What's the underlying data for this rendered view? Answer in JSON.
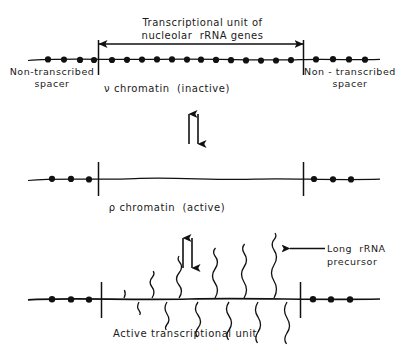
{
  "figure": {
    "title_line1": "Transcriptional unit of",
    "title_line2": "nucleolar  rRNA genes",
    "title_full": "Transcriptional unit of nucleolar rRNA genes",
    "caption": "Active transcriptional unit"
  },
  "labels": {
    "spacer_left": "Non-transcribed\nspacer",
    "spacer_right": "Non - transcribed\nspacer",
    "nu_chromatin": "ν chromatin  (inactive)",
    "rho_chromatin": "ρ chromatin  (active)",
    "long_rrna_precursor": "Long  rRNA\nprecursor"
  },
  "panels": [
    {
      "name": "inactive-chromatin-panel",
      "state": "ν chromatin (inactive)",
      "description": "DNA axis studded with evenly spaced nucleosome beads across spacer and transcription unit",
      "nucleosomes_left_spacer": 4,
      "nucleosomes_transcription_unit": 14,
      "nucleosomes_right_spacer": 4,
      "boundary_ticks": 2
    },
    {
      "name": "active-chromatin-panel",
      "state": "ρ chromatin (active)",
      "description": "Nucleosome beads only on flanking spacers; transcription unit is a smooth bead-free fibre",
      "nucleosomes_left_spacer": 3,
      "nucleosomes_transcription_unit": 0,
      "nucleosomes_right_spacer": 3,
      "boundary_ticks": 2
    },
    {
      "name": "active-transcriptional-unit-panel",
      "state": "Active transcriptional unit",
      "description": "Nascent wavy rRNA transcripts of increasing length emerge alternately above and below the DNA axis",
      "nucleosomes_left_spacer": 3,
      "nucleosomes_right_spacer": 3,
      "transcripts_above": 6,
      "transcripts_below": 6,
      "boundary_ticks": 2
    }
  ],
  "equilibrium_arrows": [
    {
      "name": "equilibrium-arrow-upper",
      "symbol": "⇅",
      "between": "ν chromatin and ρ chromatin"
    },
    {
      "name": "equilibrium-arrow-lower",
      "symbol": "⇅",
      "between": "ρ chromatin and active transcriptional unit"
    }
  ],
  "span_arrow": {
    "name": "transcription-unit-span-arrow",
    "style": "double-headed",
    "spans": "Transcriptional unit of nucleolar rRNA genes"
  },
  "colors": {
    "ink": "#111111",
    "background": "#ffffff"
  }
}
